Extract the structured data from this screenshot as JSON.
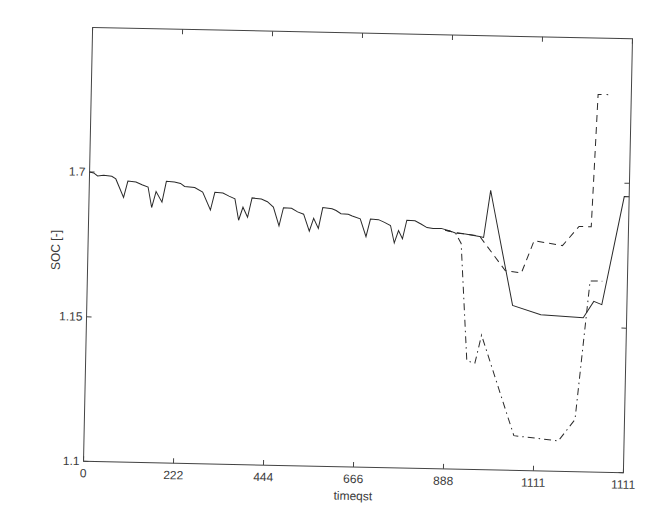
{
  "chart_data": {
    "type": "line",
    "title": "",
    "xlabel": "timestep",
    "xlabel_rendered": "timeqst",
    "ylabel": "SOC [-]",
    "grid": false,
    "legend": null,
    "x_tick_labels": [
      "0",
      "222",
      "444",
      "666",
      "888",
      "1111",
      "1111"
    ],
    "x_tick_positions": [
      0,
      222,
      444,
      666,
      888,
      1110,
      1332
    ],
    "xlim": [
      0,
      1332
    ],
    "y_tick_labels": [
      "1.1",
      "1.15",
      "1.7"
    ],
    "y_tick_fractions": [
      0.0,
      0.333,
      0.667
    ],
    "ylim_fraction": [
      0,
      1
    ],
    "series": [
      {
        "name": "solid",
        "style": "solid",
        "points": [
          [
            0,
            0.667
          ],
          [
            10,
            0.665
          ],
          [
            20,
            0.658
          ],
          [
            35,
            0.66
          ],
          [
            55,
            0.658
          ],
          [
            65,
            0.652
          ],
          [
            85,
            0.61
          ],
          [
            95,
            0.648
          ],
          [
            115,
            0.646
          ],
          [
            130,
            0.64
          ],
          [
            145,
            0.635
          ],
          [
            155,
            0.588
          ],
          [
            165,
            0.625
          ],
          [
            180,
            0.601
          ],
          [
            190,
            0.649
          ],
          [
            210,
            0.648
          ],
          [
            225,
            0.645
          ],
          [
            235,
            0.638
          ],
          [
            260,
            0.636
          ],
          [
            280,
            0.626
          ],
          [
            300,
            0.585
          ],
          [
            310,
            0.626
          ],
          [
            330,
            0.625
          ],
          [
            345,
            0.618
          ],
          [
            360,
            0.612
          ],
          [
            370,
            0.563
          ],
          [
            380,
            0.593
          ],
          [
            392,
            0.57
          ],
          [
            402,
            0.615
          ],
          [
            425,
            0.613
          ],
          [
            440,
            0.607
          ],
          [
            455,
            0.595
          ],
          [
            470,
            0.552
          ],
          [
            480,
            0.594
          ],
          [
            500,
            0.593
          ],
          [
            515,
            0.585
          ],
          [
            530,
            0.58
          ],
          [
            545,
            0.541
          ],
          [
            555,
            0.571
          ],
          [
            567,
            0.548
          ],
          [
            577,
            0.596
          ],
          [
            600,
            0.594
          ],
          [
            610,
            0.59
          ],
          [
            622,
            0.583
          ],
          [
            640,
            0.582
          ],
          [
            650,
            0.578
          ],
          [
            670,
            0.572
          ],
          [
            685,
            0.531
          ],
          [
            695,
            0.572
          ],
          [
            715,
            0.571
          ],
          [
            730,
            0.565
          ],
          [
            745,
            0.558
          ],
          [
            755,
            0.518
          ],
          [
            765,
            0.547
          ],
          [
            775,
            0.528
          ],
          [
            785,
            0.571
          ],
          [
            805,
            0.57
          ],
          [
            820,
            0.563
          ],
          [
            835,
            0.555
          ],
          [
            850,
            0.553
          ],
          [
            870,
            0.554
          ],
          [
            890,
            0.549
          ],
          [
            905,
            0.544
          ],
          [
            930,
            0.542
          ],
          [
            965,
            0.537
          ],
          [
            975,
            0.535
          ],
          [
            990,
            0.644
          ],
          [
            1000,
            0.6
          ],
          [
            1050,
            0.38
          ],
          [
            1120,
            0.36
          ],
          [
            1225,
            0.355
          ],
          [
            1250,
            0.393
          ],
          [
            1270,
            0.386
          ],
          [
            1320,
            0.636
          ],
          [
            1332,
            0.636
          ]
        ]
      },
      {
        "name": "dashed",
        "style": "dashed",
        "points": [
          [
            880,
            0.55
          ],
          [
            905,
            0.545
          ],
          [
            930,
            0.542
          ],
          [
            965,
            0.538
          ],
          [
            1030,
            0.46
          ],
          [
            1070,
            0.455
          ],
          [
            1100,
            0.53
          ],
          [
            1170,
            0.52
          ],
          [
            1210,
            0.565
          ],
          [
            1240,
            0.565
          ],
          [
            1250,
            0.87
          ],
          [
            1275,
            0.87
          ]
        ]
      },
      {
        "name": "dash-dot",
        "style": "dashdot",
        "points": [
          [
            880,
            0.55
          ],
          [
            905,
            0.545
          ],
          [
            920,
            0.52
          ],
          [
            940,
            0.25
          ],
          [
            960,
            0.245
          ],
          [
            975,
            0.31
          ],
          [
            1060,
            0.08
          ],
          [
            1170,
            0.07
          ],
          [
            1210,
            0.12
          ],
          [
            1240,
            0.44
          ],
          [
            1270,
            0.44
          ]
        ]
      }
    ]
  }
}
